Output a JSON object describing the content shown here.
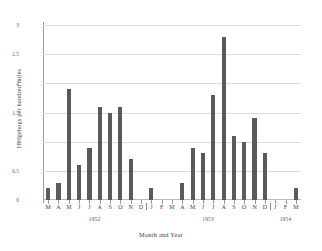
{
  "chart_data": {
    "type": "bar",
    "title": "",
    "xlabel": "Month and Year",
    "ylabel": "Hedgehogs per hundred miles",
    "ylim": [
      0,
      3
    ],
    "yticks": [
      "0",
      "0.5",
      "1",
      "1.5",
      "2",
      "2.5",
      "3"
    ],
    "ytick_values": [
      0,
      0.5,
      1,
      1.5,
      2,
      2.5,
      3
    ],
    "grid": true,
    "legend": "none",
    "categories": [
      "M",
      "A",
      "M",
      "J",
      "J",
      "A",
      "S",
      "O",
      "N",
      "D",
      "J",
      "F",
      "M",
      "A",
      "M",
      "J",
      "J",
      "A",
      "S",
      "O",
      "N",
      "D",
      "J",
      "F",
      "M"
    ],
    "values": [
      0.2,
      0.3,
      1.9,
      0.6,
      0.9,
      1.6,
      1.5,
      1.6,
      0.7,
      0.0,
      0.2,
      0.0,
      0.0,
      0.3,
      0.9,
      0.8,
      1.8,
      2.8,
      1.1,
      1.0,
      1.4,
      0.8,
      0.0,
      0.0,
      0.2
    ],
    "group_labels": [
      "1952",
      "1953",
      "1954"
    ],
    "group_spans": [
      [
        0,
        9
      ],
      [
        10,
        21
      ],
      [
        22,
        24
      ]
    ],
    "bar_color": "#5a5a5a"
  }
}
